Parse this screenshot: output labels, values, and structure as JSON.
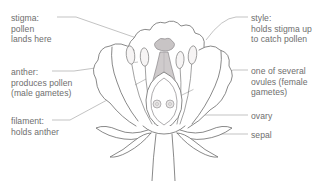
{
  "diagram": {
    "colors": {
      "background": "#ffffff",
      "text": "#6e6e6e",
      "leader_line": "#a9a9a9",
      "outline": "#6b6b6b",
      "pistil_fill": "#cfcbcc",
      "anther_fill": "#f4f2f2",
      "ovule_fill": "#e8e6e6"
    },
    "labels": [
      {
        "id": "stigma",
        "side": "left",
        "lines": [
          "stigma:",
          "pollen",
          "lands here"
        ],
        "text": "stigma:\npollen\nlands here"
      },
      {
        "id": "anther",
        "side": "left",
        "lines": [
          "anther:",
          "produces pollen",
          "(male gametes)"
        ],
        "text": "anther:\nproduces pollen\n(male gametes)"
      },
      {
        "id": "filament",
        "side": "left",
        "lines": [
          "filament:",
          "holds anther"
        ],
        "text": "filament:\nholds anther"
      },
      {
        "id": "style",
        "side": "right",
        "lines": [
          "style:",
          "holds stigma up",
          "to catch pollen"
        ],
        "text": "style:\nholds stigma up\nto catch pollen"
      },
      {
        "id": "ovules",
        "side": "right",
        "lines": [
          "one of several",
          "ovules (female",
          "gametes)"
        ],
        "text": "one of several\novules (female\ngametes)"
      },
      {
        "id": "ovary",
        "side": "right",
        "lines": [
          "ovary"
        ],
        "text": "ovary"
      },
      {
        "id": "sepal",
        "side": "right",
        "lines": [
          "sepal"
        ],
        "text": "sepal"
      }
    ],
    "parts": [
      "petals",
      "stigma",
      "style",
      "ovary",
      "ovules",
      "anthers",
      "filaments",
      "sepals",
      "stem",
      "receptacle"
    ]
  }
}
